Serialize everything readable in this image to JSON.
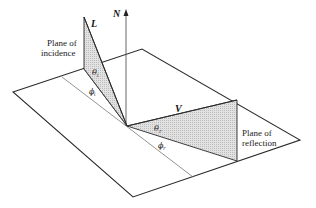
{
  "diagram": {
    "labels": {
      "normal": "N",
      "light": "L",
      "view": "V",
      "plane_incidence_line1": "Plane of",
      "plane_incidence_line2": "incidence",
      "plane_reflection_line1": "Plane of",
      "plane_reflection_line2": "reflection",
      "theta_i": "θ",
      "theta_i_sub": "i",
      "phi_i": "ϕ",
      "phi_i_sub": "i",
      "theta_r": "θ",
      "theta_r_sub": "r",
      "phi_r": "ϕ",
      "phi_r_sub": "r"
    },
    "colors": {
      "stroke": "#2a2a2a",
      "thin_stroke": "#555555",
      "shade": "#d6d6d6",
      "background": "#ffffff"
    }
  }
}
